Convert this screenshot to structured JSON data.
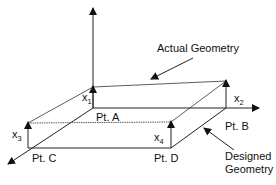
{
  "diagram": {
    "labels": {
      "actual_geometry": "Actual Geometry",
      "designed_geometry_line1": "Designed",
      "designed_geometry_line2": "Geometry",
      "pt_a": "Pt. A",
      "pt_b": "Pt. B",
      "pt_c": "Pt. C",
      "pt_d": "Pt. D",
      "x1": "x",
      "x1_sub": "1",
      "x2": "x",
      "x2_sub": "2",
      "x3": "x",
      "x3_sub": "3",
      "x4": "x",
      "x4_sub": "4"
    },
    "colors": {
      "line": "#222222",
      "background": "#ffffff"
    }
  }
}
